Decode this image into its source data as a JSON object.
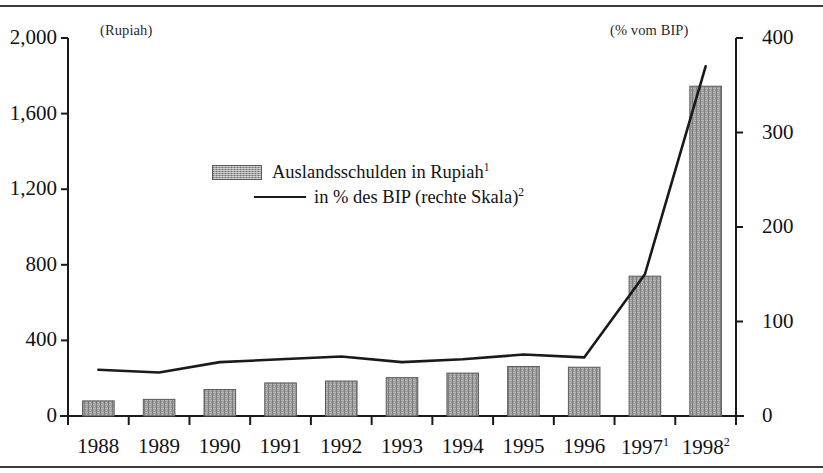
{
  "figure": {
    "left_axis_caption": "(Rupiah)",
    "right_axis_caption": "(% vom BIP)"
  },
  "legend": {
    "items": [
      {
        "label": "Auslandsschulden in Rupiah",
        "footnote": "1",
        "marker": "bar-swatch"
      },
      {
        "label": "in % des BIP (rechte Skala)",
        "footnote": "2",
        "marker": "line-swatch"
      }
    ]
  },
  "chart_data": {
    "type": "bar",
    "title": "",
    "xlabel": "",
    "ylabel": "(Rupiah)",
    "y2label": "(% vom BIP)",
    "grid": false,
    "legend_position": "inside-upper-center",
    "categories": [
      "1988",
      "1989",
      "1990",
      "1991",
      "1992",
      "1993",
      "1994",
      "1995",
      "1996",
      "1997",
      "1998"
    ],
    "category_labels": [
      "1988",
      "1989",
      "1990",
      "1991",
      "1992",
      "1993",
      "1994",
      "1995",
      "1996",
      "1997¹",
      "1998²"
    ],
    "ylim": [
      0,
      2000
    ],
    "yticks": [
      0,
      400,
      800,
      1200,
      1600,
      2000
    ],
    "ytick_labels": [
      "0",
      "400",
      "800",
      "1,200",
      "1,600",
      "2,000"
    ],
    "y2lim": [
      0,
      400
    ],
    "y2ticks": [
      0,
      100,
      200,
      300,
      400
    ],
    "y2tick_labels": [
      "0",
      "100",
      "200",
      "300",
      "400"
    ],
    "series": [
      {
        "name": "Auslandsschulden in Rupiah",
        "type": "bar",
        "axis": "left",
        "values": [
          80,
          88,
          140,
          175,
          185,
          203,
          227,
          262,
          258,
          740,
          1745
        ]
      },
      {
        "name": "in % des BIP (rechte Skala)",
        "type": "line",
        "axis": "right",
        "values": [
          49,
          46,
          57,
          60,
          63,
          57,
          60,
          65,
          62,
          150,
          370
        ]
      }
    ]
  },
  "colors": {
    "bar_fill": "#9d9d9d",
    "bar_edge": "#5a5a5a",
    "line": "#1a1a1a",
    "axis": "#1a1a1a",
    "text": "#111111",
    "background": "#ffffff"
  }
}
